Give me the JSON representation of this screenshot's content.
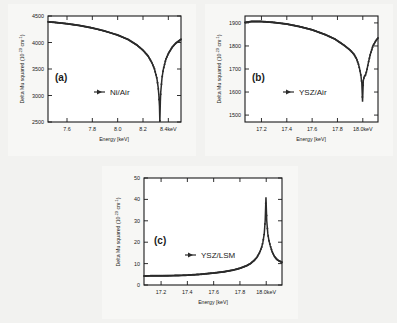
{
  "figure": {
    "background_color": "#f2f2f0",
    "panel_background": "#ffffff",
    "curve_color": "#2b2b2b"
  },
  "chart_data": [
    {
      "type": "line",
      "panel": "(a)",
      "title": "",
      "legend": "Ni/Air",
      "legend_position": "center",
      "xlabel": "Energy [keV]",
      "ylabel": "Delta Mu squared (10-20 cm-1)",
      "ylabel_prefix": "Delta Mu squared (10",
      "ylabel_exponent": "-20",
      "ylabel_suffix": " cm",
      "ylabel_exponent2": "-1",
      "ylabel_end": ")",
      "xlim": [
        7.45,
        8.5
      ],
      "ylim": [
        2500,
        4500
      ],
      "grid": false,
      "xticks": [
        7.6,
        7.8,
        8.0,
        8.2,
        8.4
      ],
      "xticklabels": [
        "7.6",
        "7.8",
        "8.0",
        "8.2",
        "8.4keV"
      ],
      "yticks": [
        2500,
        3000,
        3500,
        4000,
        4500
      ],
      "yticklabels": [
        "2500",
        "3000",
        "3500",
        "4000",
        "4500"
      ],
      "edge_energy": 8.333,
      "x": [
        7.45,
        7.5,
        7.6,
        7.7,
        7.8,
        7.9,
        8.0,
        8.08,
        8.15,
        8.2,
        8.24,
        8.27,
        8.29,
        8.31,
        8.32,
        8.325,
        8.33,
        8.333,
        8.337,
        8.34,
        8.35,
        8.36,
        8.38,
        8.4,
        8.43,
        8.46,
        8.5
      ],
      "y": [
        4390,
        4380,
        4355,
        4320,
        4275,
        4215,
        4140,
        4060,
        3955,
        3855,
        3745,
        3620,
        3505,
        3320,
        3150,
        3010,
        2800,
        2500,
        2880,
        3060,
        3330,
        3490,
        3680,
        3790,
        3910,
        3990,
        4060
      ]
    },
    {
      "type": "line",
      "panel": "(b)",
      "title": "",
      "legend": "YSZ/Air",
      "legend_position": "center",
      "xlabel": "Energy [keV]",
      "ylabel": "Delta Mu squared (10-20 cm-1)",
      "ylabel_prefix": "Delta Mu squared (10",
      "ylabel_exponent": "-20",
      "ylabel_suffix": " cm",
      "ylabel_exponent2": "-1",
      "ylabel_end": ")",
      "xlim": [
        17.07,
        18.12
      ],
      "ylim": [
        1470,
        1930
      ],
      "grid": false,
      "xticks": [
        17.2,
        17.4,
        17.6,
        17.8,
        18.0
      ],
      "xticklabels": [
        "17.2",
        "17.4",
        "17.6",
        "17.8",
        "18.0keV"
      ],
      "yticks": [
        1500,
        1600,
        1700,
        1800,
        1900
      ],
      "yticklabels": [
        "1500",
        "1600",
        "1700",
        "1800",
        "1900"
      ],
      "edge_energy": 17.998,
      "x": [
        17.07,
        17.12,
        17.2,
        17.3,
        17.4,
        17.5,
        17.6,
        17.7,
        17.78,
        17.85,
        17.9,
        17.93,
        17.95,
        17.965,
        17.975,
        17.985,
        17.992,
        17.998,
        18.004,
        18.012,
        18.02,
        18.03,
        18.045,
        18.06,
        18.08,
        18.1,
        18.12
      ],
      "y": [
        1902,
        1906,
        1906,
        1902,
        1895,
        1884,
        1870,
        1850,
        1830,
        1804,
        1782,
        1764,
        1745,
        1722,
        1700,
        1672,
        1640,
        1558,
        1650,
        1668,
        1672,
        1690,
        1730,
        1765,
        1800,
        1820,
        1835
      ]
    },
    {
      "type": "line",
      "panel": "(c)",
      "title": "",
      "legend": "YSZ/LSM",
      "legend_position": "center",
      "xlabel": "Energy [keV]",
      "ylabel": "Delta Mu squared (10-20 cm-1)",
      "ylabel_prefix": "Delta Mu squared (10",
      "ylabel_exponent": "-20",
      "ylabel_suffix": " cm",
      "ylabel_exponent2": "-1",
      "ylabel_end": ")",
      "xlim": [
        17.07,
        18.12
      ],
      "ylim": [
        0,
        50
      ],
      "grid": false,
      "xticks": [
        17.2,
        17.4,
        17.6,
        17.8,
        18.0
      ],
      "xticklabels": [
        "17.2",
        "17.4",
        "17.6",
        "17.8",
        "18.0keV"
      ],
      "yticks": [
        0,
        10,
        20,
        30,
        40,
        50
      ],
      "yticklabels": [
        "0",
        "10",
        "20",
        "30",
        "40",
        "50"
      ],
      "edge_energy": 17.998,
      "peak_value": 41,
      "x": [
        17.07,
        17.12,
        17.2,
        17.3,
        17.4,
        17.5,
        17.6,
        17.68,
        17.75,
        17.8,
        17.85,
        17.88,
        17.91,
        17.93,
        17.95,
        17.965,
        17.975,
        17.985,
        17.992,
        17.998,
        18.004,
        18.012,
        18.02,
        18.03,
        18.045,
        18.06,
        18.08,
        18.1,
        18.12
      ],
      "y": [
        4.2,
        4.3,
        4.3,
        4.4,
        4.6,
        5.0,
        5.6,
        6.2,
        7.0,
        7.8,
        9.0,
        10.0,
        11.6,
        13.0,
        15.2,
        17.6,
        20.0,
        24.0,
        30.0,
        41.0,
        30.0,
        24.0,
        21.0,
        18.5,
        15.6,
        13.6,
        12.0,
        11.2,
        10.6
      ]
    }
  ]
}
